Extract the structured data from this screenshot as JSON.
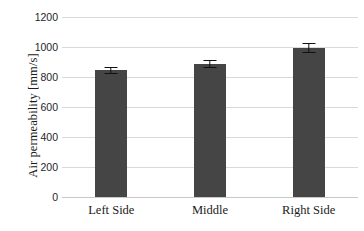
{
  "chart_data": {
    "type": "bar",
    "title": "",
    "xlabel": "",
    "ylabel": "Air permeability [mm/s]",
    "categories": [
      "Left Side",
      "Middle",
      "Right Side"
    ],
    "values": [
      850,
      890,
      995
    ],
    "errors": [
      20,
      25,
      30
    ],
    "ylim": [
      0,
      1200
    ],
    "ytick_labels": [
      "0",
      "200",
      "400",
      "600",
      "800",
      "1000",
      "1200"
    ],
    "ytick_values": [
      0,
      200,
      400,
      600,
      800,
      1000,
      1200
    ],
    "grid": true,
    "legend": null,
    "series": [
      {
        "name": "Air permeability",
        "values": [
          850,
          890,
          995
        ],
        "errors": [
          20,
          25,
          30
        ],
        "color": "#454545"
      }
    ],
    "colors": {
      "bar": "#454545",
      "gridline": "#d9d9d9",
      "baseline": "#c8c8c8",
      "errorbar": "#111111",
      "text": "#1a1a1a",
      "background": "#ffffff"
    },
    "error_bar_style": "capped",
    "annotations": []
  }
}
